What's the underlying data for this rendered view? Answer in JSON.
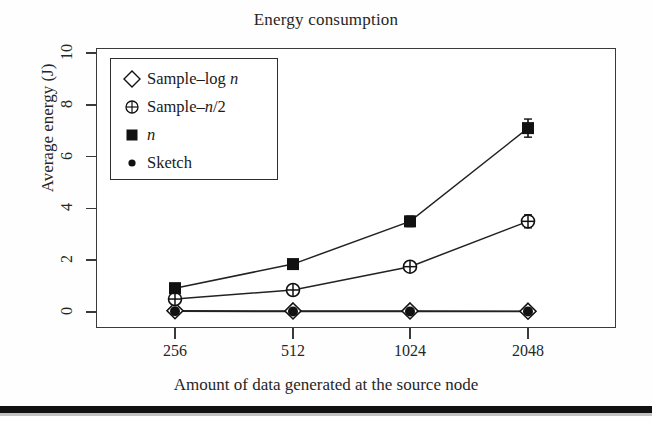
{
  "chart_data": {
    "type": "line",
    "title": "Energy consumption",
    "xlabel": "Amount of data generated at the source node",
    "ylabel": "Average energy (J)",
    "categories": [
      "256",
      "512",
      "1024",
      "2048"
    ],
    "x_tick_labels": [
      "256",
      "512",
      "1024",
      "2048"
    ],
    "y_tick_labels": [
      "0",
      "2",
      "4",
      "6",
      "8",
      "10"
    ],
    "y_ticks": [
      0,
      2,
      4,
      6,
      8,
      10
    ],
    "ylim": [
      -0.6,
      10.6
    ],
    "grid": false,
    "legend_position": "top-left inside plot",
    "series": [
      {
        "name": "Sample-log n",
        "marker": "open-diamond",
        "values": [
          0.05,
          0.04,
          0.04,
          0.03
        ],
        "errors": [
          0.12,
          0.08,
          0.08,
          0.08
        ]
      },
      {
        "name": "Sample-n/2",
        "marker": "circle-plus",
        "values": [
          0.5,
          0.85,
          1.75,
          3.5
        ],
        "errors": [
          0.15,
          0.12,
          0.15,
          0.25
        ]
      },
      {
        "name": "n",
        "marker": "filled-square",
        "values": [
          0.92,
          1.85,
          3.5,
          7.1
        ],
        "errors": [
          0.18,
          0.15,
          0.2,
          0.35
        ]
      },
      {
        "name": "Sketch",
        "marker": "filled-circle",
        "values": [
          0.03,
          0.02,
          0.02,
          0.02
        ],
        "errors": [
          0.08,
          0.06,
          0.06,
          0.06
        ]
      }
    ]
  },
  "legend": {
    "entries": [
      {
        "marker": "open-diamond",
        "label_pre": "Sample–log ",
        "label_ital": "n",
        "label_post": ""
      },
      {
        "marker": "circle-plus",
        "label_pre": "Sample–",
        "label_ital": "n",
        "label_post": "/2"
      },
      {
        "marker": "filled-square",
        "label_pre": "",
        "label_ital": "n",
        "label_post": ""
      },
      {
        "marker": "filled-circle",
        "label_pre": "Sketch",
        "label_ital": "",
        "label_post": ""
      }
    ]
  },
  "colors": {
    "ink": "#1a1a1a",
    "frame": "#3a3a3a",
    "background": "#fefefe",
    "rule": "#111111"
  }
}
